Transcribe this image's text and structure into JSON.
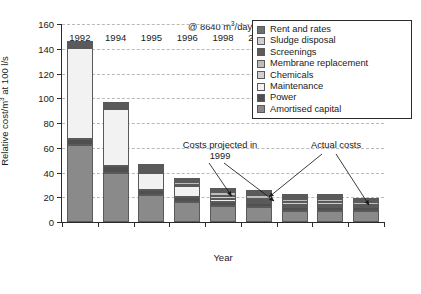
{
  "chart_data": {
    "type": "bar",
    "subtype": "stacked",
    "title": "",
    "xlabel": "Year",
    "ylabel": "Relative cost/m3 at 100 l/s",
    "ylabel_display": "Relative cost/m",
    "ylabel_sup": "3",
    "ylabel_tail": " at 100 l/s",
    "ylim": [
      0,
      160
    ],
    "ytick_step": 20,
    "yticks": [
      0,
      20,
      40,
      60,
      80,
      100,
      120,
      140,
      160
    ],
    "grid": "horizontal-dashed",
    "legend_position": "top-right",
    "categories": [
      "1992",
      "1994",
      "1995",
      "1996",
      "1998",
      "2000",
      "2002",
      "2004",
      "2005"
    ],
    "series": [
      {
        "name": "Amortised capital",
        "color": "#8a8a8a",
        "values": [
          62,
          40,
          22,
          16,
          13,
          12,
          9,
          9,
          9
        ]
      },
      {
        "name": "Power",
        "color": "#4f4f4f",
        "values": [
          5,
          5,
          4,
          4,
          3,
          3,
          3,
          3,
          3
        ]
      },
      {
        "name": "Maintenance",
        "color": "#f2f2f2",
        "values": [
          74,
          46,
          14,
          9,
          3,
          2,
          2,
          2,
          1
        ]
      },
      {
        "name": "Chemicals",
        "color": "#d0d0d0",
        "values": [
          1,
          1,
          1,
          1,
          2,
          2,
          2,
          2,
          1
        ]
      },
      {
        "name": "Membrane replacement",
        "color": "#bdbdbd",
        "values": [
          1,
          1,
          2,
          2,
          3,
          3,
          3,
          3,
          2
        ]
      },
      {
        "name": "Screenings",
        "color": "#5c5c5c",
        "values": [
          1,
          1,
          1,
          1,
          1,
          1,
          1,
          1,
          1
        ]
      },
      {
        "name": "Sludge disposal",
        "color": "#cfcfcf",
        "values": [
          1,
          1,
          1,
          1,
          1,
          1,
          1,
          1,
          1
        ]
      },
      {
        "name": "Rent and rates",
        "color": "#6e6e6e",
        "values": [
          1,
          1,
          1,
          1,
          1,
          1,
          1,
          1,
          1
        ]
      }
    ],
    "totals": [
      146,
      96,
      46,
      34,
      27,
      24,
      21,
      21,
      18
    ],
    "annotations": [
      {
        "name": "capacity-note",
        "text": "@ 8640 m3/day",
        "text_pre": "@ 8640 m",
        "text_sup": "3",
        "text_post": "/day"
      },
      {
        "name": "projected-note",
        "line1": "Costs projected in",
        "line2": "1999",
        "points_to": [
          "2000",
          "2002"
        ]
      },
      {
        "name": "actual-note",
        "line1": "Actual costs",
        "points_to": [
          "2002",
          "2005"
        ]
      }
    ]
  },
  "legend": {
    "items": [
      {
        "label": "Rent and rates",
        "color": "#6e6e6e"
      },
      {
        "label": "Sludge disposal",
        "color": "#cfcfcf"
      },
      {
        "label": "Screenings",
        "color": "#5c5c5c"
      },
      {
        "label": "Membrane replacement",
        "color": "#bdbdbd"
      },
      {
        "label": "Chemicals",
        "color": "#d0d0d0"
      },
      {
        "label": "Maintenance",
        "color": "#f2f2f2"
      },
      {
        "label": "Power",
        "color": "#4f4f4f"
      },
      {
        "label": "Amortised capital",
        "color": "#8a8a8a"
      }
    ]
  },
  "annotations": {
    "capacity_pre": "@ 8640 m",
    "capacity_sup": "3",
    "capacity_post": "/day",
    "projected_line1": "Costs projected in",
    "projected_line2": "1999",
    "actual": "Actual costs"
  },
  "axes": {
    "x_title": "Year",
    "y_title_pre": "Relative cost/m",
    "y_title_sup": "3",
    "y_title_post": " at 100 l/s"
  },
  "colors": {
    "axis": "#2b2b2b",
    "grid": "#b9b9b9",
    "background": "#ffffff"
  }
}
